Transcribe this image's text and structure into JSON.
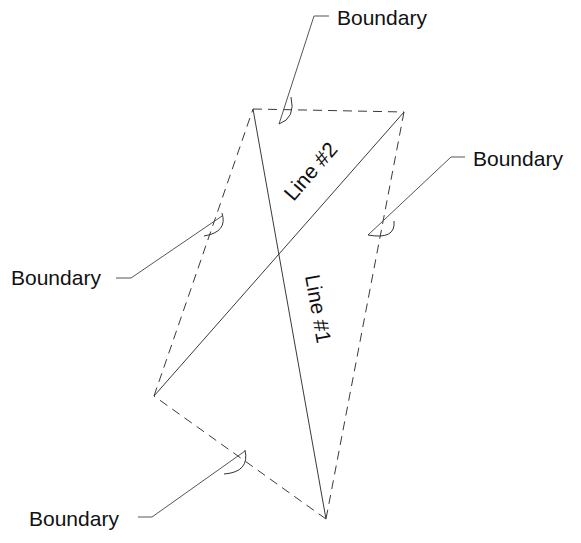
{
  "diagram": {
    "labels": {
      "boundary_top": "Boundary",
      "boundary_right": "Boundary",
      "boundary_left": "Boundary",
      "boundary_bottom": "Boundary",
      "line1": "Line #1",
      "line2": "Line #2"
    },
    "vertices": {
      "top_left": [
        253,
        109
      ],
      "top_right": [
        404,
        112
      ],
      "left": [
        154,
        396
      ],
      "bottom": [
        326,
        519
      ]
    },
    "edges": [
      {
        "name": "boundary-top",
        "from": "top_left",
        "to": "top_right",
        "style": "dashed"
      },
      {
        "name": "boundary-right",
        "from": "top_right",
        "to": "bottom",
        "style": "dashed"
      },
      {
        "name": "boundary-bottom",
        "from": "bottom",
        "to": "left",
        "style": "dashed"
      },
      {
        "name": "boundary-left",
        "from": "left",
        "to": "top_left",
        "style": "dashed"
      },
      {
        "name": "line-1",
        "from": "top_left",
        "to": "bottom",
        "style": "solid"
      },
      {
        "name": "line-2",
        "from": "left",
        "to": "top_right",
        "style": "solid"
      }
    ],
    "colors": {
      "line": "#3a3a3a",
      "leader": "#555555",
      "text": "#111111",
      "background": "#ffffff"
    }
  }
}
